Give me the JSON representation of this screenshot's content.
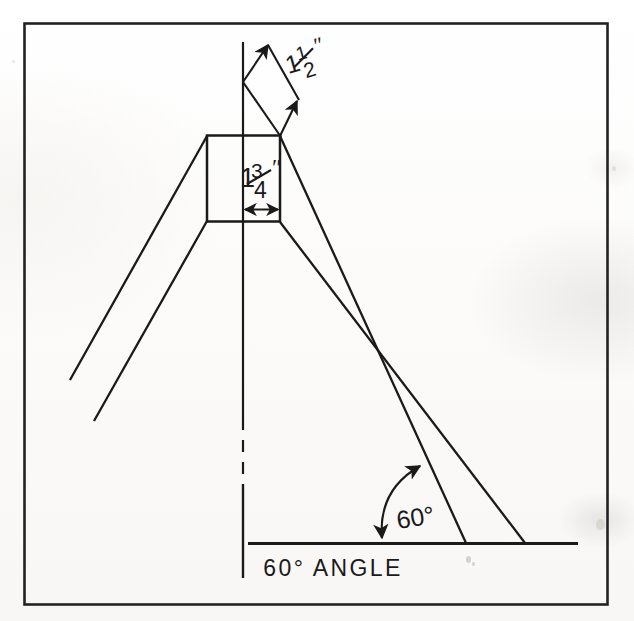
{
  "drawing": {
    "title": "60 Degree Angle Leg Assembly Detail",
    "caption": "60° ANGLE",
    "angle_label": "60°",
    "angle_value": 60,
    "angle_unit": "degrees",
    "ink_color": "#1a1a1a",
    "paper_color": "#fdfdfc",
    "frame": {
      "x": 23,
      "y": 22,
      "width": 585,
      "height": 583
    },
    "dimensions": [
      {
        "id": "thickness-diagonal",
        "whole": "1",
        "numerator": "1",
        "denominator": "2",
        "unit": "″",
        "text": "1½″",
        "description": "diagonal stock thickness"
      },
      {
        "id": "width-horizontal",
        "whole": "1",
        "numerator": "3",
        "denominator": "4",
        "unit": "″",
        "text": "1¾″",
        "description": "horizontal block width"
      }
    ],
    "parts": {
      "center_line": "vertical dashed center axis",
      "ground_line": "horizontal base reference line",
      "block": "square joint block at apex",
      "left_leg": "left splayed leg, two parallel edges",
      "right_leg": "right splayed leg, two parallel edges",
      "angle_arc": "double headed arc between ground line and right leg"
    }
  }
}
